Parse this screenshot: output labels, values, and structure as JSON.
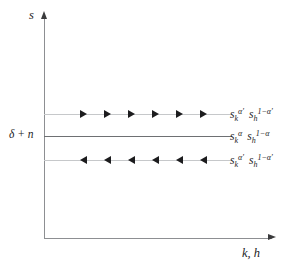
{
  "figure": {
    "type": "phase-diagram",
    "axes": {
      "y_label": "s",
      "x_label": "k, h",
      "y_arrow_icon": "arrow-up-icon",
      "x_arrow_icon": "arrow-right-icon"
    },
    "level_label": "δ + n",
    "lines": [
      {
        "id": "top",
        "name": "upper-savings-curve",
        "label_parts": {
          "term1_base": "s",
          "term1_sub": "k",
          "term1_sup": "α'",
          "term2_base": "s",
          "term2_sub": "h",
          "term2_sup": "1−α'"
        },
        "arrow_direction": "right",
        "arrow_count": 6,
        "style": "light",
        "color": "#c6c8ca"
      },
      {
        "id": "middle",
        "name": "steady-state-curve",
        "label_parts": {
          "term1_base": "s",
          "term1_sub": "k",
          "term1_sup": "α",
          "term2_base": "s",
          "term2_sub": "h",
          "term2_sup": "1−α"
        },
        "arrow_direction": "none",
        "arrow_count": 0,
        "style": "dark",
        "color": "#6e7073"
      },
      {
        "id": "bottom",
        "name": "lower-savings-curve",
        "label_parts": {
          "term1_base": "s",
          "term1_sub": "k",
          "term1_sup": "α'",
          "term2_base": "s",
          "term2_sub": "h",
          "term2_sup": "1−α'"
        },
        "arrow_direction": "left",
        "arrow_count": 6,
        "style": "light",
        "color": "#c6c8ca"
      }
    ],
    "colors": {
      "axis": "#8d8f92",
      "text": "#1c1c1e",
      "marker": "#1c1c1e",
      "line_light": "#c6c8ca",
      "line_dark": "#6e7073",
      "background": "#ffffff"
    }
  }
}
